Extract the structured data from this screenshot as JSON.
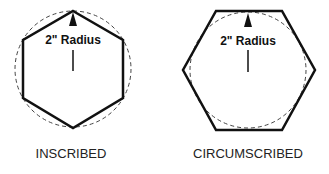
{
  "diagrams": [
    {
      "id": "inscribed",
      "caption": "INSCRIBED",
      "radius_label": "2\" Radius",
      "description": "Hexagon inscribed in a dashed circle; vertices touch the circle"
    },
    {
      "id": "circumscribed",
      "caption": "CIRCUMSCRIBED",
      "radius_label": "2\" Radius",
      "description": "Hexagon circumscribed about a dashed circle; sides tangent to the circle"
    }
  ],
  "colors": {
    "stroke": "#111111",
    "dashed": "#444444",
    "background": "#ffffff"
  }
}
